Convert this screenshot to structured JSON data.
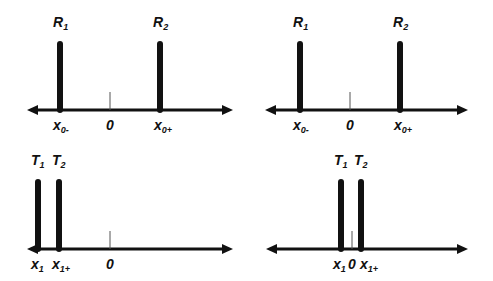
{
  "colors": {
    "ink": "#111111",
    "tick": "#555555",
    "background": "#ffffff"
  },
  "panels": [
    {
      "id": "top-left",
      "axis": {
        "y": 110,
        "x1": 27,
        "x2": 233
      },
      "zero": {
        "x": 110,
        "label": "0"
      },
      "bars": [
        {
          "x": 60,
          "top": 44,
          "name": "R",
          "sub": "1"
        },
        {
          "x": 160,
          "top": 44,
          "name": "R",
          "sub": "2"
        }
      ],
      "ticks": [
        {
          "x": 53,
          "name": "x",
          "sub": "0-"
        },
        {
          "x": 154,
          "name": "x",
          "sub": "0+"
        }
      ]
    },
    {
      "id": "top-right",
      "axis": {
        "y": 110,
        "x1": 265,
        "x2": 468
      },
      "zero": {
        "x": 350,
        "label": "0"
      },
      "bars": [
        {
          "x": 300,
          "top": 44,
          "name": "R",
          "sub": "1"
        },
        {
          "x": 400,
          "top": 44,
          "name": "R",
          "sub": "2"
        }
      ],
      "ticks": [
        {
          "x": 293,
          "name": "x",
          "sub": "0-"
        },
        {
          "x": 394,
          "name": "x",
          "sub": "0+"
        }
      ]
    },
    {
      "id": "bottom-left",
      "axis": {
        "y": 249,
        "x1": 27,
        "x2": 233
      },
      "zero": {
        "x": 110,
        "label": "0"
      },
      "bars": [
        {
          "x": 38,
          "top": 182,
          "name": "T",
          "sub": "1"
        },
        {
          "x": 59,
          "top": 182,
          "name": "T",
          "sub": "2"
        }
      ],
      "ticks": [
        {
          "x": 31,
          "name": "x",
          "sub": "1"
        },
        {
          "x": 52,
          "name": "x",
          "sub": "1+"
        }
      ]
    },
    {
      "id": "bottom-right",
      "axis": {
        "y": 249,
        "x1": 266,
        "x2": 468
      },
      "zero": {
        "x": 352,
        "label": "0"
      },
      "bars": [
        {
          "x": 341,
          "top": 182,
          "name": "T",
          "sub": "1"
        },
        {
          "x": 361,
          "top": 182,
          "name": "T",
          "sub": "2"
        }
      ],
      "ticks": [
        {
          "x": 333,
          "name": "x",
          "sub": "1"
        },
        {
          "x": 360,
          "name": "x",
          "sub": "1+"
        }
      ]
    }
  ]
}
